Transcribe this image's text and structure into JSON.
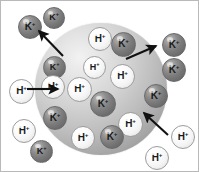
{
  "figure": {
    "width": 199,
    "height": 172,
    "background_color": "#ffffff",
    "border_color": "#b9b9b9"
  },
  "cell": {
    "name": "cell-sphere",
    "center_x": 100,
    "center_y": 88,
    "radius": 66,
    "fill_light": "#f2f2f2",
    "fill_dark": "#858585"
  },
  "legend": {
    "potassium_label": "K",
    "potassium_charge": "+",
    "potassium_color": "#7a7a7a",
    "hydrogen_label": "H",
    "hydrogen_charge": "+",
    "hydrogen_color": "#fbfbfb"
  },
  "ions": [
    {
      "id": "k-out-tl-1",
      "species": "K",
      "charge": "+",
      "x": 17,
      "y": 14,
      "size": 24,
      "font": 10,
      "location": "outside"
    },
    {
      "id": "k-out-tl-2",
      "species": "K",
      "charge": "+",
      "x": 42,
      "y": 6,
      "size": 22,
      "font": 9,
      "location": "outside"
    },
    {
      "id": "k-in-left-1",
      "species": "K",
      "charge": "+",
      "x": 42,
      "y": 55,
      "size": 23,
      "font": 9,
      "location": "inside"
    },
    {
      "id": "h-in-top-1",
      "species": "H",
      "charge": "+",
      "x": 87,
      "y": 26,
      "size": 24,
      "font": 10,
      "location": "inside"
    },
    {
      "id": "k-in-top-1",
      "species": "K",
      "charge": "+",
      "x": 110,
      "y": 31,
      "size": 25,
      "font": 10,
      "location": "inside"
    },
    {
      "id": "k-out-r-1",
      "species": "K",
      "charge": "+",
      "x": 161,
      "y": 32,
      "size": 24,
      "font": 10,
      "location": "outside"
    },
    {
      "id": "k-out-r-2",
      "species": "K",
      "charge": "+",
      "x": 161,
      "y": 57,
      "size": 24,
      "font": 10,
      "location": "outside"
    },
    {
      "id": "h-in-mid-1",
      "species": "H",
      "charge": "+",
      "x": 82,
      "y": 55,
      "size": 23,
      "font": 9,
      "location": "inside"
    },
    {
      "id": "h-in-mid-2",
      "species": "H",
      "charge": "+",
      "x": 109,
      "y": 63,
      "size": 25,
      "font": 10,
      "location": "inside"
    },
    {
      "id": "h-out-l-1",
      "species": "H",
      "charge": "+",
      "x": 8,
      "y": 78,
      "size": 25,
      "font": 10,
      "location": "outside"
    },
    {
      "id": "h-in-mid-3",
      "species": "H",
      "charge": "+",
      "x": 66,
      "y": 76,
      "size": 25,
      "font": 10,
      "location": "inside"
    },
    {
      "id": "h-in-mid-4",
      "species": "H",
      "charge": "+",
      "x": 40,
      "y": 74,
      "size": 24,
      "font": 10,
      "location": "inside"
    },
    {
      "id": "k-in-ctr-1",
      "species": "K",
      "charge": "+",
      "x": 89,
      "y": 90,
      "size": 26,
      "font": 10,
      "location": "inside"
    },
    {
      "id": "k-in-r-1",
      "species": "K",
      "charge": "+",
      "x": 143,
      "y": 83,
      "size": 24,
      "font": 10,
      "location": "inside"
    },
    {
      "id": "k-in-bl-1",
      "species": "K",
      "charge": "+",
      "x": 42,
      "y": 105,
      "size": 24,
      "font": 10,
      "location": "inside"
    },
    {
      "id": "h-out-l-2",
      "species": "H",
      "charge": "+",
      "x": 11,
      "y": 118,
      "size": 24,
      "font": 10,
      "location": "outside"
    },
    {
      "id": "h-in-br-1",
      "species": "H",
      "charge": "+",
      "x": 117,
      "y": 111,
      "size": 25,
      "font": 10,
      "location": "inside"
    },
    {
      "id": "h-in-b-1",
      "species": "H",
      "charge": "+",
      "x": 70,
      "y": 125,
      "size": 24,
      "font": 10,
      "location": "inside"
    },
    {
      "id": "k-in-b-1",
      "species": "K",
      "charge": "+",
      "x": 99,
      "y": 124,
      "size": 24,
      "font": 10,
      "location": "inside"
    },
    {
      "id": "k-out-b-1",
      "species": "K",
      "charge": "+",
      "x": 29,
      "y": 139,
      "size": 23,
      "font": 9,
      "location": "outside"
    },
    {
      "id": "h-out-br-1",
      "species": "H",
      "charge": "+",
      "x": 170,
      "y": 124,
      "size": 24,
      "font": 10,
      "location": "outside"
    },
    {
      "id": "h-out-b-1",
      "species": "H",
      "charge": "+",
      "x": 144,
      "y": 145,
      "size": 24,
      "font": 10,
      "location": "outside"
    }
  ],
  "arrows": [
    {
      "id": "arrow-k-efflux-topleft",
      "direction": "outward",
      "x1": 62,
      "y1": 55,
      "x2": 38,
      "y2": 30,
      "meaning": "K+ moves out of the cell"
    },
    {
      "id": "arrow-k-efflux-topright",
      "direction": "outward",
      "x1": 125,
      "y1": 58,
      "x2": 155,
      "y2": 45,
      "meaning": "K+ moves out of the cell"
    },
    {
      "id": "arrow-h-influx-left",
      "direction": "inward",
      "x1": 26,
      "y1": 88,
      "x2": 57,
      "y2": 88,
      "meaning": "H+ moves into the cell"
    },
    {
      "id": "arrow-h-influx-bottomright",
      "direction": "inward",
      "x1": 167,
      "y1": 134,
      "x2": 143,
      "y2": 112,
      "meaning": "H+ moves into the cell"
    }
  ]
}
